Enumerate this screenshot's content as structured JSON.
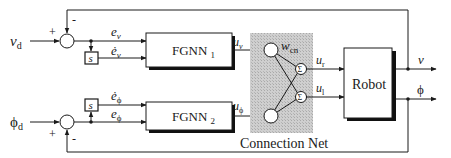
{
  "diagram": {
    "inputs": {
      "velocity_ref": {
        "base": "v",
        "sub": "d"
      },
      "heading_ref": {
        "base": "ϕ",
        "sub": "d"
      }
    },
    "summing_junctions": {
      "top": {
        "plus": "+",
        "minus": "-"
      },
      "bottom": {
        "plus": "+",
        "minus": "-"
      }
    },
    "signals": {
      "e_v": {
        "base": "e",
        "sub": "v"
      },
      "e_v_dot": {
        "base": "ė",
        "sub": "v"
      },
      "e_phi": {
        "base": "e",
        "sub": "ϕ"
      },
      "e_phi_dot": {
        "base": "ė",
        "sub": "ϕ"
      },
      "u_v": {
        "base": "u",
        "sub": "v"
      },
      "u_phi": {
        "base": "u",
        "sub": "ϕ"
      },
      "w_cn": {
        "base": "w",
        "sub": "cn"
      },
      "u_r": {
        "base": "u",
        "sub": "r"
      },
      "u_l": {
        "base": "u",
        "sub": "l"
      }
    },
    "derivative_blocks": {
      "top": "s",
      "bottom": "s"
    },
    "blocks": {
      "fgnn1": {
        "name": "FGNN",
        "sub": "1"
      },
      "fgnn2": {
        "name": "FGNN",
        "sub": "2"
      },
      "robot": "Robot",
      "connection_net_label": "Connection Net",
      "sum_node_symbol": "Σ"
    },
    "outputs": {
      "velocity": "v",
      "heading": "ϕ"
    },
    "colors": {
      "line": "#1a1a1a",
      "shaded_region": "#c8c8c8",
      "shadow": "#111111",
      "background": "#ffffff"
    }
  }
}
